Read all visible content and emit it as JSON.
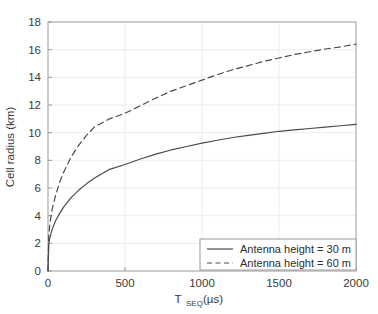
{
  "figure": {
    "background_color": "#ffffff",
    "axes_color": "#999999",
    "grid_color": "#e8e8e8",
    "line_color": "#4a4a4a",
    "text_color": "#3a3a3a"
  },
  "chart_data": {
    "type": "line",
    "title": "",
    "xlabel_main": "T",
    "xlabel_sub": "SEQ",
    "xlabel_unit": "(µs)",
    "xlabel": "T_SEQ (µs)",
    "ylabel": "Cell radius (km)",
    "xlim": [
      0,
      2000
    ],
    "ylim": [
      0,
      18
    ],
    "xticks": [
      0,
      500,
      1000,
      1500,
      2000
    ],
    "xtick_labels": [
      "0",
      "500",
      "1000",
      "1500",
      "2000"
    ],
    "yticks": [
      0,
      2,
      4,
      6,
      8,
      10,
      12,
      14,
      16,
      18
    ],
    "ytick_labels": [
      "0",
      "2",
      "4",
      "6",
      "8",
      "10",
      "12",
      "14",
      "16",
      "18"
    ],
    "grid": true,
    "legend_position": "lower right",
    "series": [
      {
        "name": "Antenna height = 30 m",
        "style": "solid",
        "color": "#4a4a4a",
        "x": [
          0,
          5,
          10,
          20,
          30,
          50,
          75,
          100,
          150,
          200,
          250,
          300,
          400,
          500,
          600,
          700,
          800,
          900,
          1000,
          1100,
          1200,
          1300,
          1400,
          1500,
          1600,
          1700,
          1800,
          1900,
          2000
        ],
        "y": [
          0.0,
          1.95,
          2.3,
          2.75,
          3.1,
          3.65,
          4.15,
          4.6,
          5.3,
          5.85,
          6.3,
          6.7,
          7.35,
          7.7,
          8.1,
          8.45,
          8.75,
          9.0,
          9.25,
          9.45,
          9.65,
          9.8,
          9.95,
          10.1,
          10.2,
          10.3,
          10.4,
          10.5,
          10.6
        ]
      },
      {
        "name": "Antenna height = 60 m",
        "style": "dashed",
        "color": "#4a4a4a",
        "x": [
          0,
          5,
          10,
          20,
          30,
          50,
          75,
          100,
          150,
          200,
          250,
          300,
          400,
          500,
          600,
          700,
          800,
          900,
          1000,
          1100,
          1200,
          1300,
          1400,
          1500,
          1600,
          1700,
          1800,
          1900,
          2000
        ],
        "y": [
          0.0,
          2.6,
          3.2,
          4.0,
          4.6,
          5.5,
          6.4,
          7.1,
          8.25,
          9.1,
          9.8,
          10.4,
          11.0,
          11.4,
          11.95,
          12.5,
          13.0,
          13.4,
          13.8,
          14.2,
          14.55,
          14.85,
          15.15,
          15.4,
          15.65,
          15.85,
          16.05,
          16.2,
          16.4
        ]
      }
    ]
  },
  "legend": {
    "items": [
      {
        "label": "Antenna height = 30 m",
        "style": "solid"
      },
      {
        "label": "Antenna height = 60 m",
        "style": "dashed"
      }
    ]
  }
}
